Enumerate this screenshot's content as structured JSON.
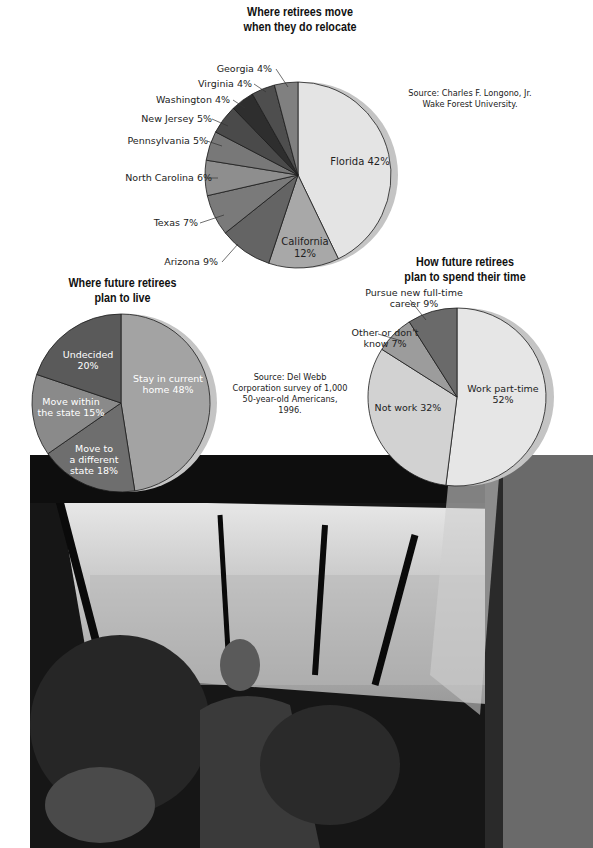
{
  "chart_data": [
    {
      "type": "pie",
      "title": "Where retirees move when they do relocate",
      "title_lines": [
        "Where retirees move",
        "when they do relocate"
      ],
      "source_lines": [
        "Source:  Charles F. Longono, Jr.",
        "Wake Forest University."
      ],
      "slices": [
        {
          "label": "Florida",
          "value": 42,
          "text": "Florida  42%",
          "color": "#e4e4e4"
        },
        {
          "label": "California",
          "value": 12,
          "text": "California 12%",
          "color": "#a8a8a8"
        },
        {
          "label": "Arizona",
          "value": 9,
          "text": "Arizona  9%",
          "color": "#646464"
        },
        {
          "label": "Texas",
          "value": 7,
          "text": "Texas  7%",
          "color": "#7a7a7a"
        },
        {
          "label": "North Carolina",
          "value": 6,
          "text": "North Carolina  6%",
          "color": "#8e8e8e"
        },
        {
          "label": "Pennsylvania",
          "value": 5,
          "text": "Pennsylvania  5%",
          "color": "#787878"
        },
        {
          "label": "New Jersey",
          "value": 5,
          "text": "New Jersey  5%",
          "color": "#4a4a4a"
        },
        {
          "label": "Washington",
          "value": 4,
          "text": "Washington  4%",
          "color": "#2e2e2e"
        },
        {
          "label": "Virginia",
          "value": 4,
          "text": "Virginia  4%",
          "color": "#4e4e4e"
        },
        {
          "label": "Georgia",
          "value": 4,
          "text": "Georgia  4%",
          "color": "#808080"
        }
      ]
    },
    {
      "type": "pie",
      "title": "Where future retirees plan to live",
      "title_lines": [
        "Where future retirees",
        "plan to live"
      ],
      "slices": [
        {
          "label": "Stay in current home",
          "value": 48,
          "text": "Stay in current home 48%",
          "color": "#a3a3a3"
        },
        {
          "label": "Move to a different state",
          "value": 18,
          "text": "Move to a different state 18%",
          "color": "#6e6e6e"
        },
        {
          "label": "Move within the state",
          "value": 15,
          "text": "Move within the state 15%",
          "color": "#8a8a8a"
        },
        {
          "label": "Undecided",
          "value": 20,
          "text": "Undecided 20%",
          "color": "#5a5a5a"
        }
      ]
    },
    {
      "type": "pie",
      "title": "How future retirees plan to spend their time",
      "title_lines": [
        "How future retirees",
        "plan to spend their time"
      ],
      "source_lines": [
        "Source:  Del Webb",
        "Corporation survey of 1,000",
        "50-year-old Americans,",
        "1996."
      ],
      "slices": [
        {
          "label": "Work part-time",
          "value": 52,
          "text": "Work part-time 52%",
          "color": "#e6e6e6"
        },
        {
          "label": "Not work",
          "value": 32,
          "text": "Not work  32%",
          "color": "#d2d2d2"
        },
        {
          "label": "Other or don't know",
          "value": 7,
          "text": "Other or don't know  7%",
          "color": "#9c9c9c"
        },
        {
          "label": "Pursue new full-time career",
          "value": 9,
          "text": "Pursue new full-time career  9%",
          "color": "#6a6a6a"
        }
      ]
    }
  ],
  "photo": {
    "description": "Black-and-white photo of a man tending plants in a sunroom greenhouse"
  }
}
